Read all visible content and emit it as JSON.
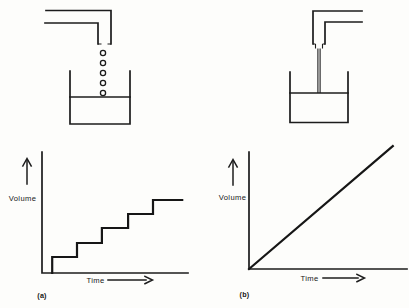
{
  "colors": {
    "ink": "#1c1c1c",
    "paper": "#fdfdfb"
  },
  "figure": {
    "panels": [
      {
        "caption": "(a)",
        "apparatus": "tap dripping separate drops into a beaker of water",
        "drops_count": 5,
        "graph": {
          "ylabel": "Volume",
          "xlabel": "Time"
        }
      },
      {
        "caption": "(b)",
        "apparatus": "tap pouring a continuous stream into a beaker of water",
        "graph": {
          "ylabel": "Volume",
          "xlabel": "Time"
        }
      }
    ]
  },
  "chart_data": [
    {
      "type": "line",
      "panel": "(a)",
      "title": "",
      "xlabel": "Time",
      "ylabel": "Volume",
      "shape": "staircase (volume rises in equal discrete steps)",
      "axis_ticks": "none (unscaled axes with arrows)",
      "series": [
        {
          "name": "Volume vs Time (dripping tap)",
          "points": [
            [
              0.07,
              0
            ],
            [
              0.07,
              0.132
            ],
            [
              0.24,
              0.132
            ],
            [
              0.24,
              0.248
            ],
            [
              0.41,
              0.248
            ],
            [
              0.41,
              0.372
            ],
            [
              0.59,
              0.372
            ],
            [
              0.59,
              0.488
            ],
            [
              0.76,
              0.488
            ],
            [
              0.76,
              0.603
            ],
            [
              0.96,
              0.603
            ]
          ]
        }
      ]
    },
    {
      "type": "line",
      "panel": "(b)",
      "title": "",
      "xlabel": "Time",
      "ylabel": "Volume",
      "shape": "straight line through the origin (steady increase)",
      "axis_ticks": "none (unscaled axes with arrows)",
      "series": [
        {
          "name": "Volume vs Time (steady stream)",
          "points": [
            [
              0,
              0
            ],
            [
              0.91,
              1.05
            ]
          ]
        }
      ]
    }
  ]
}
